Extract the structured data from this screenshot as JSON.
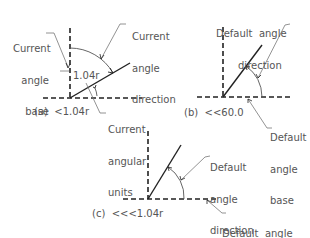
{
  "panels": [
    {
      "id": "a",
      "caption": "(a)  <1.04r",
      "value_label": "1.04r",
      "labels": {
        "base": [
          "Current",
          "angle",
          "base"
        ],
        "direction": [
          "Current",
          "angle",
          "direction"
        ],
        "units": [
          "Current",
          "angular",
          "units"
        ]
      }
    },
    {
      "id": "b",
      "caption": "(b)  <<60.0",
      "labels": {
        "direction": [
          "Default  angle",
          "direction"
        ],
        "base": [
          "Default",
          "angle",
          "base"
        ]
      }
    },
    {
      "id": "c",
      "caption": "(c)  <<<1.04r",
      "labels": {
        "direction": [
          "Default",
          "angle",
          "direction"
        ],
        "base": [
          "Default  angle",
          "base"
        ]
      }
    }
  ],
  "colors": {
    "line": "#222222",
    "leader": "#777777",
    "text": "#555555"
  }
}
